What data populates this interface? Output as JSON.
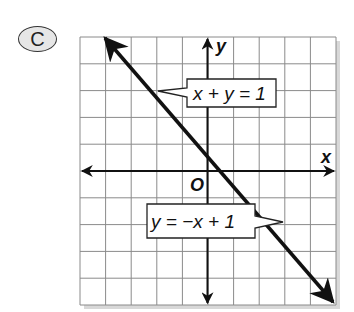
{
  "badge": {
    "label": "C"
  },
  "chart_data": {
    "type": "line",
    "title": "",
    "xlabel": "x",
    "ylabel": "y",
    "origin_label": "O",
    "xlim": [
      -5,
      5
    ],
    "ylim": [
      -5,
      5
    ],
    "grid": true,
    "grid_step": 1,
    "series": [
      {
        "name": "y = −x + 1",
        "equation": "x + y = 1",
        "slope": -1,
        "intercept": 1,
        "points": [
          [
            -4,
            5
          ],
          [
            0,
            1
          ],
          [
            1,
            0
          ],
          [
            5,
            -4
          ]
        ]
      }
    ],
    "annotations": [
      {
        "text": "x + y = 1",
        "points_to": [
          -2,
          3
        ]
      },
      {
        "text": "y = −x + 1",
        "points_to": [
          3,
          -2
        ]
      }
    ]
  },
  "colors": {
    "grid": "#8a8a8a",
    "line": "#111111",
    "label_bg": "#ffffff",
    "badge_bg": "#e6e6e6"
  }
}
